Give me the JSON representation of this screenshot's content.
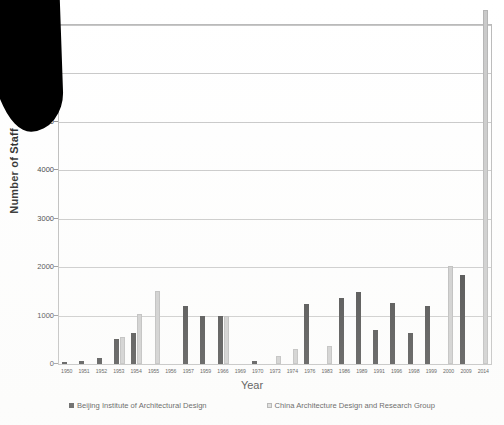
{
  "chart_data": {
    "type": "bar",
    "title": "",
    "xlabel": "Year",
    "ylabel": "Number of Staff",
    "ylim": [
      0,
      7000
    ],
    "yticks": [
      0,
      1000,
      2000,
      3000,
      4000,
      5000,
      6000,
      7000
    ],
    "ytick_labels": [
      "0",
      "1000",
      "2000",
      "3000",
      "4000",
      "5000",
      "6000",
      "7000"
    ],
    "grid": "horizontal",
    "legend_position": "bottom",
    "categories": [
      "1950",
      "1951",
      "1952",
      "1953",
      "1954",
      "1955",
      "1956",
      "1957",
      "1959",
      "1966",
      "1969",
      "1970",
      "1973",
      "1974",
      "1976",
      "1983",
      "1986",
      "1989",
      "1991",
      "1996",
      "1998",
      "1999",
      "2000",
      "2009",
      "2014"
    ],
    "series": [
      {
        "name": "Beijing Institute of Architectural Design",
        "color": "#333333",
        "values": [
          40,
          55,
          120,
          520,
          640,
          0,
          0,
          1190,
          1000,
          1000,
          0,
          60,
          0,
          0,
          1230,
          0,
          1370,
          1480,
          700,
          1250,
          650,
          1200,
          0,
          1830,
          0
        ]
      },
      {
        "name": "China Architecture Design and Research Group",
        "color": "#c9c9c9",
        "values": [
          0,
          0,
          0,
          550,
          1030,
          1500,
          0,
          0,
          0,
          1000,
          0,
          0,
          160,
          300,
          0,
          380,
          0,
          0,
          0,
          0,
          0,
          0,
          2020,
          0,
          7300
        ]
      }
    ]
  },
  "axis": {
    "y_title": "Number of Staff",
    "x_title": "Year"
  },
  "legend": {
    "entries": [
      {
        "label": "Beijing Institute of Architectural Design",
        "swatch": "dark-square-icon"
      },
      {
        "label": "China Architecture Design and Research Group",
        "swatch": "light-square-icon"
      }
    ]
  },
  "artifact": {
    "name": "scan-shadow-artifact"
  }
}
